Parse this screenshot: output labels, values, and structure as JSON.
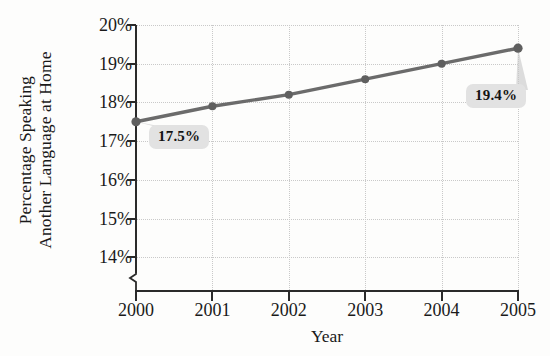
{
  "chart_data": {
    "type": "line",
    "title": "",
    "xlabel": "Year",
    "ylabel_lines": [
      "Percentage Speaking",
      "Another Language at Home"
    ],
    "categories": [
      "2000",
      "2001",
      "2002",
      "2003",
      "2004",
      "2005"
    ],
    "x": [
      2000,
      2001,
      2002,
      2003,
      2004,
      2005
    ],
    "values": [
      17.5,
      17.9,
      18.2,
      18.6,
      19.0,
      19.4
    ],
    "ytick_labels": [
      "20%",
      "19%",
      "18%",
      "17%",
      "16%",
      "15%",
      "14%"
    ],
    "ytick_values": [
      20,
      19,
      18,
      17,
      16,
      15,
      14
    ],
    "ylim": [
      13.5,
      20
    ],
    "xlim": [
      2000,
      2005
    ],
    "grid": true,
    "grid_style": "dotted",
    "legend": "none",
    "axis_break": true,
    "annotations": [
      {
        "label": "17.5%",
        "point_index": 0,
        "value": 17.5
      },
      {
        "label": "19.4%",
        "point_index": 5,
        "value": 19.4
      }
    ],
    "series_color": "#6b6b6b",
    "marker_color": "#5f5f5f",
    "grid_color": "#c9c9c9",
    "axis_color": "#2a2a2a",
    "callout_bg": "#e2e2e2",
    "background": "#fdfdfc"
  }
}
